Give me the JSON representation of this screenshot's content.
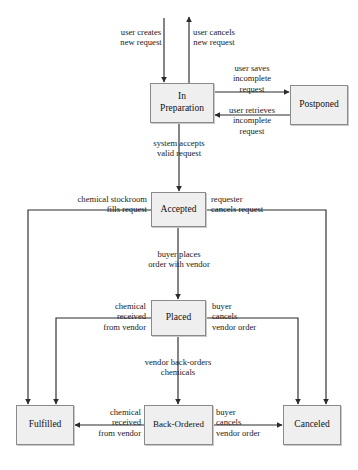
{
  "diagram": {
    "type": "state-diagram",
    "canvas": {
      "width": 358,
      "height": 470
    },
    "style": {
      "box_fill": "#efefef",
      "box_border": "#8a8a8a",
      "line_color": "#2b2b2b",
      "text_color": "#1a1a1a",
      "background": "#ffffff"
    },
    "states": [
      {
        "id": "in-preparation",
        "label": "In\nPreparation",
        "x": 150,
        "y": 83,
        "w": 64,
        "h": 40
      },
      {
        "id": "postponed",
        "label": "Postponed",
        "x": 290,
        "y": 85,
        "w": 58,
        "h": 40
      },
      {
        "id": "accepted",
        "label": "Accepted",
        "x": 151,
        "y": 192,
        "w": 55,
        "h": 35
      },
      {
        "id": "placed",
        "label": "Placed",
        "x": 151,
        "y": 300,
        "w": 55,
        "h": 36
      },
      {
        "id": "fulfilled",
        "label": "Fulfilled",
        "x": 16,
        "y": 405,
        "w": 58,
        "h": 40
      },
      {
        "id": "back-ordered",
        "label": "Back-Ordered",
        "x": 144,
        "y": 405,
        "w": 69,
        "h": 40
      },
      {
        "id": "canceled",
        "label": "Canceled",
        "x": 283,
        "y": 405,
        "w": 58,
        "h": 40
      }
    ],
    "transitions": [
      {
        "id": "t-create",
        "from": "(start)",
        "to": "in-preparation",
        "label": "user creates\nnew request"
      },
      {
        "id": "t-cancel-new",
        "from": "in-preparation",
        "to": "(end)",
        "label": "user cancels\nnew request"
      },
      {
        "id": "t-save-incomplete",
        "from": "in-preparation",
        "to": "postponed",
        "label": "user saves\nincomplete\nrequest"
      },
      {
        "id": "t-retrieve-incomplete",
        "from": "postponed",
        "to": "in-preparation",
        "label": "user retrieves\nincomplete\nrequest"
      },
      {
        "id": "t-accept",
        "from": "in-preparation",
        "to": "accepted",
        "label": "system accepts\nvalid request"
      },
      {
        "id": "t-stockroom-fills",
        "from": "accepted",
        "to": "fulfilled",
        "label": "chemical stockroom\nfills request"
      },
      {
        "id": "t-requester-cancels",
        "from": "accepted",
        "to": "canceled",
        "label": "requester\ncancels request"
      },
      {
        "id": "t-buyer-places",
        "from": "accepted",
        "to": "placed",
        "label": "buyer places\norder with vendor"
      },
      {
        "id": "t-placed-received",
        "from": "placed",
        "to": "fulfilled",
        "label": "chemical\nreceived\nfrom vendor"
      },
      {
        "id": "t-placed-cancel",
        "from": "placed",
        "to": "canceled",
        "label": "buyer\ncancels\nvendor order"
      },
      {
        "id": "t-backorder",
        "from": "placed",
        "to": "back-ordered",
        "label": "vendor back-orders\nchemicals"
      },
      {
        "id": "t-backordered-received",
        "from": "back-ordered",
        "to": "fulfilled",
        "label": "chemical\nreceived\nfrom vendor"
      },
      {
        "id": "t-backordered-cancel",
        "from": "back-ordered",
        "to": "canceled",
        "label": "buyer\ncancels\nvendor order"
      }
    ]
  }
}
